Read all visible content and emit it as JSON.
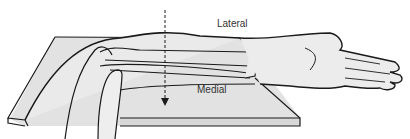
{
  "figure": {
    "labels": {
      "lateral": "Lateral",
      "medial": "Medial"
    },
    "colors": {
      "line": "#1a1a1a",
      "fill": "#e6e6e6",
      "board_top": "#dcdcdc",
      "board_edge": "#cfcfcf"
    }
  }
}
